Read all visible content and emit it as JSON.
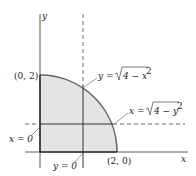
{
  "diagram": {
    "axes": {
      "x_label": "x",
      "y_label": "y"
    },
    "points": {
      "top": "(0, 2)",
      "right": "(2, 0)"
    },
    "curves": {
      "upper": {
        "lhs": "y =",
        "rad": "4 − x",
        "exp": "2"
      },
      "right": {
        "lhs": "x =",
        "rad": "4 − y",
        "exp": "2"
      }
    },
    "lines": {
      "left": "x = 0",
      "bottom": "y = 0"
    },
    "colors": {
      "fill": "#e4e4e4",
      "arc": "#666666",
      "line": "#333333"
    }
  }
}
